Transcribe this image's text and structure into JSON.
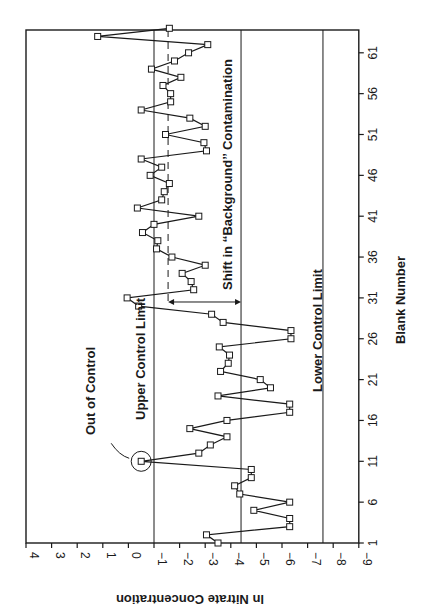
{
  "chart_data": {
    "type": "line",
    "orientation": "rotated-90-clockwise",
    "title": "",
    "xlabel": "Blank Number",
    "ylabel": "ln Nitrate Concentration",
    "x_ticks": [
      1,
      6,
      11,
      16,
      21,
      26,
      31,
      36,
      41,
      46,
      51,
      56,
      61
    ],
    "y_ticks": [
      4,
      3,
      2,
      1,
      0,
      -1,
      -2,
      -3,
      -4,
      -5,
      -6,
      -7,
      -8,
      -9
    ],
    "xlim": [
      1,
      64
    ],
    "ylim": [
      -9,
      4
    ],
    "grid": false,
    "markers": "open-square",
    "x": [
      1,
      2,
      3,
      4,
      5,
      6,
      7,
      8,
      9,
      10,
      11,
      12,
      13,
      14,
      15,
      16,
      17,
      18,
      19,
      20,
      21,
      22,
      23,
      24,
      25,
      26,
      27,
      28,
      29,
      30,
      31,
      32,
      33,
      34,
      35,
      36,
      37,
      38,
      39,
      40,
      41,
      42,
      43,
      44,
      45,
      46,
      47,
      48,
      49,
      50,
      51,
      52,
      53,
      54,
      55,
      56,
      57,
      58,
      59,
      60,
      61,
      62,
      63,
      64
    ],
    "series": [
      {
        "name": "ln Nitrate Concentration",
        "values": [
          -3.5,
          -3.05,
          -6.3,
          -6.3,
          -4.9,
          -6.3,
          -4.35,
          -4.15,
          -4.8,
          -4.8,
          -0.5,
          -2.75,
          -3.2,
          -3.85,
          -2.4,
          -3.85,
          -6.3,
          -6.3,
          -3.5,
          -5.55,
          -5.15,
          -3.6,
          -3.9,
          -3.95,
          -3.55,
          -6.35,
          -6.35,
          -3.7,
          -3.25,
          -0.4,
          0.05,
          -2.55,
          -2.45,
          -2.1,
          -3.0,
          -1.7,
          -1.1,
          -1.15,
          -0.55,
          -1.0,
          -2.75,
          -0.35,
          -1.3,
          -1.4,
          -1.6,
          -0.85,
          -1.3,
          -0.5,
          -3.05,
          -2.95,
          -1.45,
          -3.0,
          -2.4,
          -0.5,
          -1.65,
          -1.65,
          -1.35,
          -2.05,
          -0.9,
          -1.8,
          -2.35,
          -3.1,
          1.2,
          -1.6
        ]
      }
    ],
    "reference_lines": [
      {
        "name": "Upper Control Limit",
        "value": -1.0,
        "style": "solid"
      },
      {
        "name": "Center Line",
        "value": -4.4,
        "style": "solid"
      },
      {
        "name": "Lower Control Limit",
        "value": -7.6,
        "style": "solid"
      },
      {
        "name": "Shifted Background Mean",
        "value": -1.55,
        "style": "dashed",
        "from_x": 30
      }
    ],
    "annotations": [
      {
        "text": "Out of Control",
        "x": 11,
        "y": -0.5,
        "marker": "circle"
      },
      {
        "text": "Upper Control Limit"
      },
      {
        "text": "Lower Control Limit"
      },
      {
        "text": "Shift in “Background” Contamination",
        "arrow_from": -1.55,
        "arrow_to": -4.4,
        "x": 30.5
      }
    ]
  },
  "labels": {
    "xlabel": "Blank Number",
    "ylabel": "ln Nitrate Concentration",
    "out_of_control": "Out of Control",
    "ucl": "Upper Control Limit",
    "lcl": "Lower Control Limit",
    "shift": "Shift in ‘‘Background’’ Contamination"
  }
}
